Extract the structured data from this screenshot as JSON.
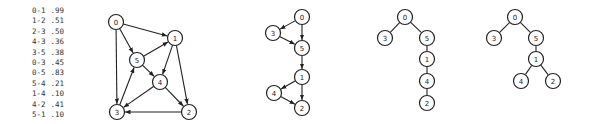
{
  "edge_list": [
    {
      "edge": "0-1",
      "weight": ".99"
    },
    {
      "edge": "1-2",
      "weight": ".51"
    },
    {
      "edge": "2-3",
      "weight": ".50"
    },
    {
      "edge": "4-3",
      "weight": ".36"
    },
    {
      "edge": "3-5",
      "weight": ".38"
    },
    {
      "edge": "0-3",
      "weight": ".45"
    },
    {
      "edge": "0-5",
      "weight": ".83"
    },
    {
      "edge": "5-4",
      "weight": ".21"
    },
    {
      "edge": "1-4",
      "weight": ".10"
    },
    {
      "edge": "4-2",
      "weight": ".41"
    },
    {
      "edge": "5-1",
      "weight": ".10"
    }
  ],
  "graphs": [
    {
      "name": "weighted-digraph",
      "directed": true,
      "nodes": [
        {
          "id": "0",
          "x": 116,
          "y": 22
        },
        {
          "id": "1",
          "x": 175,
          "y": 38
        },
        {
          "id": "5",
          "x": 137,
          "y": 60
        },
        {
          "id": "4",
          "x": 160,
          "y": 82
        },
        {
          "id": "3",
          "x": 117,
          "y": 112
        },
        {
          "id": "2",
          "x": 189,
          "y": 112
        }
      ],
      "edges": [
        [
          "0",
          "1"
        ],
        [
          "1",
          "2"
        ],
        [
          "2",
          "3"
        ],
        [
          "4",
          "3"
        ],
        [
          "3",
          "5"
        ],
        [
          "0",
          "3"
        ],
        [
          "0",
          "5"
        ],
        [
          "5",
          "4"
        ],
        [
          "1",
          "4"
        ],
        [
          "4",
          "2"
        ],
        [
          "5",
          "1"
        ]
      ]
    },
    {
      "name": "shortest-paths-tree-directed",
      "directed": true,
      "nodes": [
        {
          "id": "0",
          "x": 302,
          "y": 17
        },
        {
          "id": "3",
          "x": 273,
          "y": 33
        },
        {
          "id": "5",
          "x": 302,
          "y": 48
        },
        {
          "id": "1",
          "x": 302,
          "y": 77
        },
        {
          "id": "4",
          "x": 274,
          "y": 93
        },
        {
          "id": "2",
          "x": 302,
          "y": 108
        }
      ],
      "edges": [
        [
          "0",
          "3"
        ],
        [
          "0",
          "5"
        ],
        [
          "3",
          "5"
        ],
        [
          "5",
          "1"
        ],
        [
          "1",
          "4"
        ],
        [
          "1",
          "2"
        ],
        [
          "4",
          "2"
        ]
      ]
    },
    {
      "name": "tree-path",
      "directed": false,
      "nodes": [
        {
          "id": "0",
          "x": 405,
          "y": 17
        },
        {
          "id": "3",
          "x": 385,
          "y": 38
        },
        {
          "id": "5",
          "x": 427,
          "y": 38
        },
        {
          "id": "1",
          "x": 427,
          "y": 59
        },
        {
          "id": "4",
          "x": 427,
          "y": 81
        },
        {
          "id": "2",
          "x": 427,
          "y": 103
        }
      ],
      "edges": [
        [
          "0",
          "3"
        ],
        [
          "0",
          "5"
        ],
        [
          "5",
          "1"
        ],
        [
          "1",
          "4"
        ],
        [
          "4",
          "2"
        ]
      ]
    },
    {
      "name": "tree-branching",
      "directed": false,
      "nodes": [
        {
          "id": "0",
          "x": 515,
          "y": 17
        },
        {
          "id": "3",
          "x": 494,
          "y": 38
        },
        {
          "id": "5",
          "x": 536,
          "y": 38
        },
        {
          "id": "1",
          "x": 536,
          "y": 59
        },
        {
          "id": "4",
          "x": 521,
          "y": 81
        },
        {
          "id": "2",
          "x": 553,
          "y": 81
        }
      ],
      "edges": [
        [
          "0",
          "3"
        ],
        [
          "0",
          "5"
        ],
        [
          "5",
          "1"
        ],
        [
          "1",
          "4"
        ],
        [
          "1",
          "2"
        ]
      ]
    }
  ],
  "style": {
    "node_radius": 7.5,
    "stroke_color": "#222222",
    "text_color": "#333333",
    "background": "#ffffff"
  }
}
